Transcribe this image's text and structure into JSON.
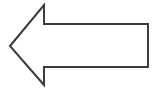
{
  "canvas": {
    "width": 158,
    "height": 89,
    "background_color": "#ffffff"
  },
  "figure": {
    "name": "left-pointing-arrow",
    "label": "Left arrow outline",
    "shape_type": "arrow",
    "direction": "left",
    "style": "outline",
    "fill_color": "#ffffff",
    "stroke_color": "#3c3c3c",
    "stroke_width": 2,
    "points": "10,46 44,5 44,24 148,24 148,67 44,67 44,85",
    "vertices": [
      {
        "name": "tip",
        "x": 10,
        "y": 46
      },
      {
        "name": "upper-barb",
        "x": 44,
        "y": 5
      },
      {
        "name": "shaft-top-left",
        "x": 44,
        "y": 24
      },
      {
        "name": "shaft-top-right",
        "x": 148,
        "y": 24
      },
      {
        "name": "shaft-bottom-right",
        "x": 148,
        "y": 67
      },
      {
        "name": "shaft-bottom-left",
        "x": 44,
        "y": 67
      },
      {
        "name": "lower-barb",
        "x": 44,
        "y": 85
      }
    ]
  }
}
